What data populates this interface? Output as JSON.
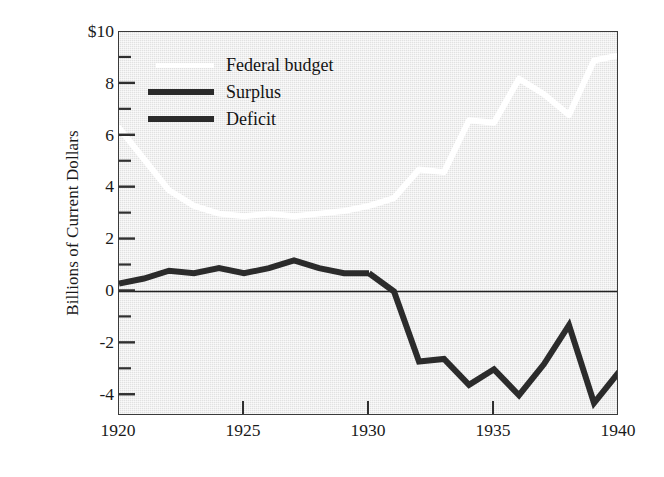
{
  "chart_data": {
    "type": "line",
    "title": "",
    "xlabel": "",
    "ylabel": "Billions of Current Dollars",
    "xlim": [
      1920,
      1940
    ],
    "ylim": [
      -4.8,
      10
    ],
    "grid": false,
    "legend_position": "upper-left-inside",
    "x_ticks": [
      "1920",
      "1925",
      "1930",
      "1935",
      "1940"
    ],
    "x_tick_values": [
      1920,
      1925,
      1930,
      1935,
      1940
    ],
    "y_ticks": [
      "$10",
      "8",
      "6",
      "4",
      "2",
      "0",
      "-2",
      "-4"
    ],
    "y_tick_values": [
      10,
      8,
      6,
      4,
      2,
      0,
      -2,
      -4
    ],
    "y_minor_tick_values": [
      9,
      7,
      5,
      3,
      1,
      -1,
      -3
    ],
    "x": [
      1920,
      1921,
      1922,
      1923,
      1924,
      1925,
      1926,
      1927,
      1928,
      1929,
      1930,
      1931,
      1932,
      1933,
      1934,
      1935,
      1936,
      1937,
      1938,
      1939,
      1940
    ],
    "series": [
      {
        "name": "Federal budget",
        "color": "#ffffff",
        "width": 6,
        "values": [
          6.3,
          5.1,
          3.9,
          3.3,
          3.0,
          2.9,
          3.0,
          2.9,
          3.0,
          3.1,
          3.3,
          3.6,
          4.7,
          4.6,
          6.6,
          6.5,
          8.2,
          7.6,
          6.8,
          8.9,
          9.1
        ]
      },
      {
        "name": "Surplus",
        "color": "#2b2b2b",
        "width": 6,
        "values": [
          0.3,
          0.5,
          0.8,
          0.7,
          0.9,
          0.7,
          0.9,
          1.2,
          0.9,
          0.7,
          0.7,
          null,
          null,
          null,
          null,
          null,
          null,
          null,
          null,
          null,
          null
        ]
      },
      {
        "name": "Deficit",
        "color": "#2b2b2b",
        "width": 6,
        "values": [
          null,
          null,
          null,
          null,
          null,
          null,
          null,
          null,
          null,
          null,
          0.7,
          0.0,
          -2.7,
          -2.6,
          -3.6,
          -3.0,
          -4.0,
          -2.8,
          -1.3,
          -4.3,
          -3.1
        ]
      }
    ],
    "legend": [
      {
        "label": "Federal budget",
        "color": "#ffffff",
        "style": "thin"
      },
      {
        "label": "Surplus",
        "color": "#2b2b2b",
        "style": "thick"
      },
      {
        "label": "Deficit",
        "color": "#2b2b2b",
        "style": "thick"
      }
    ],
    "zero_line": {
      "value": 0,
      "color": "#222222"
    },
    "background_color": "#e7e7e7",
    "frame_color": "#3a3a3a"
  }
}
